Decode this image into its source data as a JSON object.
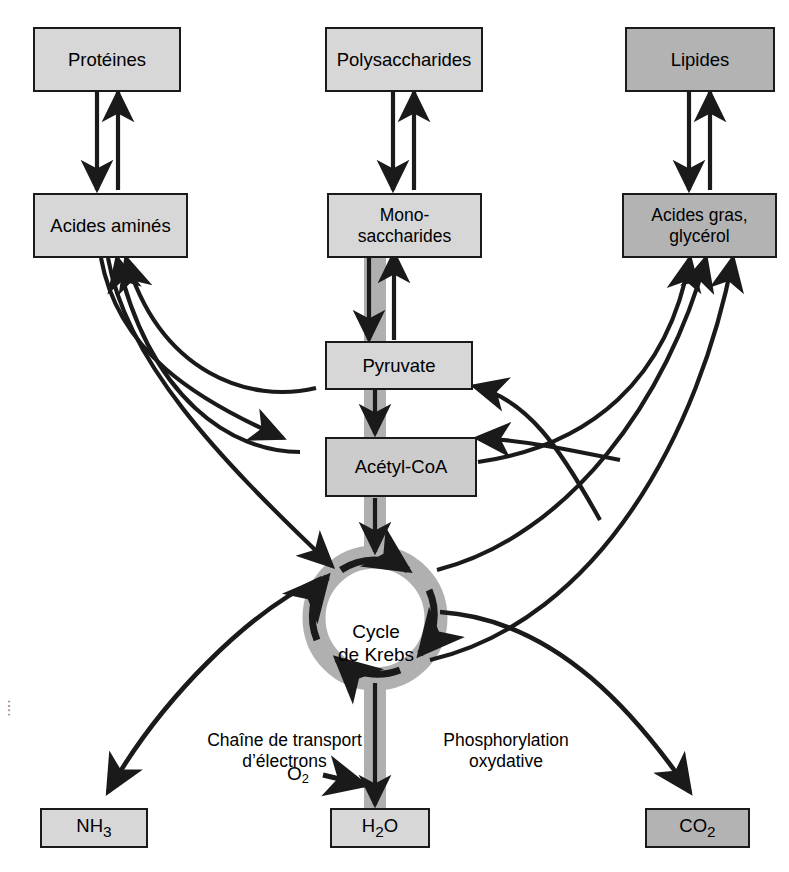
{
  "diagram": {
    "language": "fr",
    "colors": {
      "stroke": "#1a1a1a",
      "fill_light": "#d7d7d7",
      "fill_mid": "#cccccc",
      "fill_dark": "#b3b3b3",
      "pathway_band": "#b0b0b0",
      "background": "#ffffff"
    }
  },
  "nodes": {
    "proteines": "Protéines",
    "polysaccharides": "Polysaccharides",
    "lipides": "Lipides",
    "acides_amines": "Acides aminés",
    "monosaccharides": "Mono-\nsaccharides",
    "acides_gras": "Acides gras,\nglycérol",
    "pyruvate": "Pyruvate",
    "acetyl_coa": "Acétyl-CoA",
    "cycle_krebs": "Cycle\nde Krebs",
    "nh3_main": "NH",
    "nh3_sub": "3",
    "h2o_h": "H",
    "h2o_sub": "2",
    "h2o_o": "O",
    "co2_main": "CO",
    "co2_sub": "2"
  },
  "pathway_labels": {
    "electron_transport": "Chaîne de transport\nd’électrons",
    "oxidative_phosphorylation": "Phosphorylation\noxydative",
    "oxygen_main": "O",
    "oxygen_sub": "2"
  },
  "edge_caption": {
    "fragment": "•  •  •  •"
  }
}
